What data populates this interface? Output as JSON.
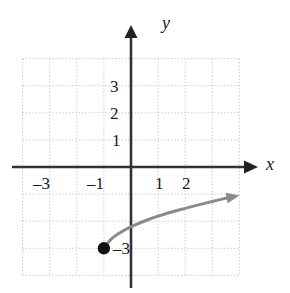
{
  "figure": {
    "kind": "cartesian-coordinate-plane-graph",
    "background_color": "#ffffff"
  },
  "axes": {
    "x_axis_label": "x",
    "y_axis_label": "y",
    "axis_color": "#333333",
    "grid_color": "#c9c9c9",
    "grid_style": "dotted",
    "x_tick_labels": [
      "–3",
      "–1",
      "1",
      "2"
    ],
    "x_tick_values": [
      -3,
      -1,
      1,
      2
    ],
    "y_tick_labels": [
      "3",
      "2",
      "1",
      "–3"
    ],
    "y_tick_values": [
      3,
      2,
      1,
      -3
    ]
  },
  "chart_data": {
    "type": "line",
    "title": "",
    "xlabel": "x",
    "ylabel": "y",
    "xlim": [
      -4,
      4
    ],
    "ylim": [
      -4,
      4
    ],
    "grid": true,
    "legend": "none",
    "series": [
      {
        "name": "square-root-curve",
        "color": "#8a8a8a",
        "line_width": 3,
        "start_point": {
          "x": -1,
          "y": -3,
          "marker": "filled-circle",
          "closed": true
        },
        "end_arrow": true,
        "x": [
          -1.0,
          -0.8,
          -0.6,
          -0.4,
          -0.2,
          0.0,
          0.4,
          0.8,
          1.2,
          1.6,
          2.0,
          2.4,
          2.8,
          3.2,
          3.6,
          4.0
        ],
        "y": [
          -3.0,
          -2.72,
          -2.55,
          -2.42,
          -2.3,
          -2.2,
          -2.03,
          -1.88,
          -1.75,
          -1.63,
          -1.52,
          -1.42,
          -1.32,
          -1.22,
          -1.13,
          -1.05
        ]
      }
    ],
    "annotations": [
      {
        "text": "–3",
        "x": -0.55,
        "y": -3.0,
        "role": "y-value-label-at-point"
      }
    ]
  }
}
